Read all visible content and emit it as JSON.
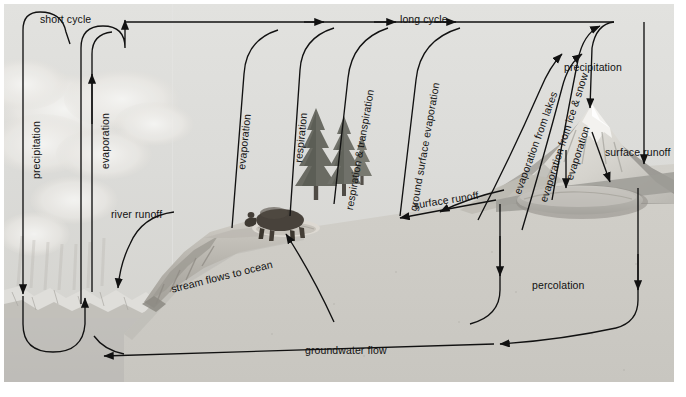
{
  "diagram": {
    "type": "hydrologic-cycle-diagram",
    "style": "grayscale-illustration",
    "colors": {
      "sky": "#dcdcd9",
      "ground": "#cfcdc7",
      "ocean": "#c2c0bb",
      "ink": "#111111",
      "page": "#ffffff",
      "mountain": "#c9c6bf",
      "lake": "#b9b7b1",
      "tree": "#6e6f67",
      "bear": "#4a443e"
    },
    "cycle_labels": [
      {
        "id": "short-cycle",
        "text": "short cycle",
        "x": 36,
        "y": 14,
        "rotated": false
      },
      {
        "id": "long-cycle",
        "text": "long cycle",
        "x": 396,
        "y": 14,
        "rotated": false
      }
    ],
    "process_labels": [
      {
        "id": "precipitation-ocean",
        "text": "precipitation",
        "x": 27,
        "y": 170,
        "rotated": true
      },
      {
        "id": "evaporation-ocean",
        "text": "evaporation",
        "x": 95,
        "y": 163,
        "rotated": true
      },
      {
        "id": "evaporation-land",
        "text": "evaporation",
        "x": 231,
        "y": 162,
        "rotated": true
      },
      {
        "id": "respiration",
        "text": "respiration",
        "x": 285,
        "y": 156,
        "rotated": true
      },
      {
        "id": "respiration-transpiration",
        "text": "respiration & transpiration",
        "x": 355,
        "y": 201,
        "rotated": true
      },
      {
        "id": "ground-surface-evaporation",
        "text": "ground surface evaporation",
        "x": 404,
        "y": 202,
        "rotated": true
      },
      {
        "id": "evaporation-from-lakes",
        "text": "evaporation from lakes",
        "x": 512,
        "y": 183,
        "rotated": true
      },
      {
        "id": "evaporation-from-ice-snow",
        "text": "evaporation from ice & snow",
        "x": 539,
        "y": 191,
        "rotated": true
      },
      {
        "id": "evaporation-lake",
        "text": "evaporation",
        "x": 563,
        "y": 170,
        "rotated": true
      },
      {
        "id": "precipitation-mountain",
        "text": "precipitation",
        "x": 560,
        "y": 63,
        "rotated": false
      },
      {
        "id": "surface-runoff-mountain",
        "text": "surface runoff",
        "x": 601,
        "y": 148,
        "rotated": false
      },
      {
        "id": "surface-runoff-plain",
        "text": "surface runoff",
        "x": 411,
        "y": 199,
        "rotated": false,
        "tilt": -9
      },
      {
        "id": "river-runoff",
        "text": "river runoff",
        "x": 109,
        "y": 210,
        "rotated": false
      },
      {
        "id": "stream-flows-to-ocean",
        "text": "stream flows to ocean",
        "x": 169,
        "y": 276,
        "rotated": false,
        "tilt": -14
      },
      {
        "id": "percolation",
        "text": "percolation",
        "x": 530,
        "y": 281,
        "rotated": false
      },
      {
        "id": "groundwater-flow",
        "text": "groundwater flow",
        "x": 303,
        "y": 345,
        "rotated": false
      }
    ],
    "scene_elements": [
      {
        "id": "cloud-bank",
        "label": "cumulus cloud bank"
      },
      {
        "id": "ocean",
        "label": "ocean with icebergs"
      },
      {
        "id": "conifer-trees",
        "label": "conifer trees"
      },
      {
        "id": "bear",
        "label": "brown bear"
      },
      {
        "id": "snowy-mountain",
        "label": "snow-capped mountain"
      },
      {
        "id": "lake",
        "label": "lake"
      },
      {
        "id": "river-delta",
        "label": "river delta / stream"
      }
    ]
  }
}
